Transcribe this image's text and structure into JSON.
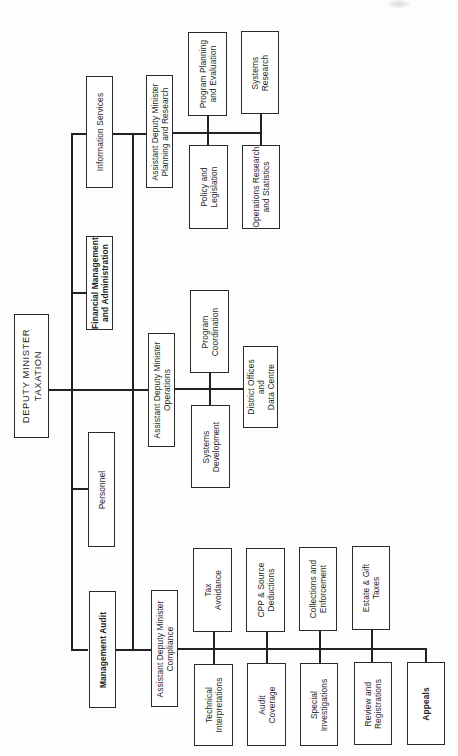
{
  "chart": {
    "orientation": "rotated 90° counter-clockwise (text reads bottom-to-top)",
    "root": {
      "label": "DEPUTY MINISTER\nTAXATION"
    },
    "staff_units": [
      {
        "id": "info_services",
        "label": "Information Services"
      },
      {
        "id": "financial_mgmt",
        "label": "Financial Management\nand Administration"
      },
      {
        "id": "personnel",
        "label": "Personnel"
      },
      {
        "id": "mgmt_audit",
        "label": "Management Audit"
      }
    ],
    "branches": [
      {
        "id": "planning",
        "label": "Assistant Deputy Minister\nPlanning and Research",
        "units_upper": [
          {
            "label": "Program Planning\nand Evaluation"
          },
          {
            "label": "Systems\nResearch"
          }
        ],
        "units_lower": [
          {
            "label": "Policy and\nLegislation"
          },
          {
            "label": "Operations Research\nand Statistics"
          }
        ]
      },
      {
        "id": "operations",
        "label": "Assistant Deputy Minister\nOperations",
        "units_upper": [
          {
            "label": "Program\nCoordination"
          }
        ],
        "units_lower": [
          {
            "label": "Systems\nDevelopment"
          }
        ],
        "units_end": [
          {
            "label": "District Offices\nand\nData Centre"
          }
        ]
      },
      {
        "id": "compliance",
        "label": "Assistant Deputy Minister\nCompliance",
        "units_upper": [
          {
            "label": "Tax\nAvoidance"
          },
          {
            "label": "CPP & Source\nDeductions"
          },
          {
            "label": "Collections and\nEnforcement"
          },
          {
            "label": "Estate & Gift\nTaxes"
          }
        ],
        "units_lower": [
          {
            "label": "Technical\nInterpretations"
          },
          {
            "label": "Audit\nCoverage"
          },
          {
            "label": "Special\nInvestigations"
          },
          {
            "label": "Review and\nRegistrations"
          },
          {
            "label": "Appeals"
          }
        ]
      }
    ]
  },
  "colors": {
    "line": "#222222",
    "box_border": "#2a2a2a",
    "background": "#ffffff",
    "text": "#1e1e1e"
  }
}
